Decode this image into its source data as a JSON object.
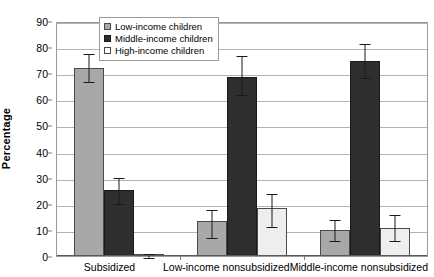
{
  "chart_data": {
    "type": "bar",
    "title": "",
    "xlabel": "",
    "ylabel": "Percentage",
    "ylim": [
      0,
      90
    ],
    "ytick_step": 10,
    "yticks": [
      90,
      80,
      70,
      60,
      50,
      40,
      30,
      20,
      10,
      0
    ],
    "grid": true,
    "legend_position": "top-center",
    "categories": [
      "Subsidized",
      "Low-income nonsubsidized",
      "Middle-income nonsubsidized"
    ],
    "series": [
      {
        "name": "Low-income children",
        "color": "#a8a8a8",
        "values": [
          72.5,
          13.5,
          10.0
        ],
        "error_low": [
          67.5,
          7.5,
          6.5
        ],
        "error_high": [
          78.0,
          18.5,
          14.5
        ]
      },
      {
        "name": "Middle-income children",
        "color": "#2e2e2e",
        "values": [
          25.5,
          69.0,
          75.5
        ],
        "error_low": [
          20.5,
          62.5,
          69.0
        ],
        "error_high": [
          30.5,
          77.5,
          82.0
        ]
      },
      {
        "name": "High-income children",
        "color": "#eeeeee",
        "values": [
          0.7,
          18.5,
          11.0
        ],
        "error_low": [
          0.0,
          12.0,
          6.5
        ],
        "error_high": [
          1.6,
          24.5,
          16.5
        ]
      }
    ]
  },
  "legend": {
    "items": [
      {
        "label": "Low-income children"
      },
      {
        "label": "Middle-income children"
      },
      {
        "label": "High-income children"
      }
    ]
  },
  "axes": {
    "y_title": "Percentage"
  }
}
